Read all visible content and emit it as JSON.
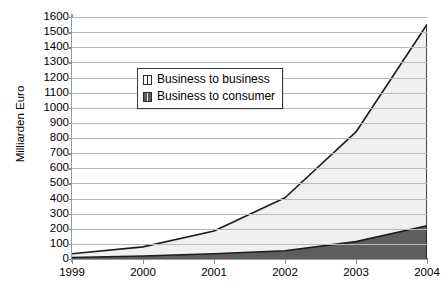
{
  "chart_data": {
    "type": "area",
    "stacked": true,
    "title": "",
    "xlabel": "",
    "ylabel": "Milliarden Euro",
    "categories": [
      "1999",
      "2000",
      "2001",
      "2002",
      "2003",
      "2004"
    ],
    "x": [
      1999,
      2000,
      2001,
      2002,
      2003,
      2004
    ],
    "series": [
      {
        "name": "Business to consumer",
        "values": [
          10,
          20,
          35,
          55,
          115,
          220
        ],
        "color": "#5e5e5e",
        "stack_order": 0
      },
      {
        "name": "Business to business",
        "values": [
          25,
          60,
          150,
          350,
          725,
          1330
        ],
        "color": "#f0f0f0",
        "stack_order": 1
      }
    ],
    "cumulative_totals": [
      35,
      80,
      185,
      405,
      840,
      1550
    ],
    "ylim": [
      0,
      1600
    ],
    "ytick_step": 100,
    "yticks": [
      0,
      100,
      200,
      300,
      400,
      500,
      600,
      700,
      800,
      900,
      1000,
      1100,
      1200,
      1300,
      1400,
      1500,
      1600
    ],
    "ytick_labels": [
      "0",
      "100",
      "200",
      "300",
      "400",
      "500",
      "600",
      "700",
      "800",
      "900",
      "1000",
      "1100",
      "1200",
      "1300",
      "1400",
      "1500",
      "1600"
    ],
    "grid": true,
    "grid_axis": "y",
    "legend_position": "upper-left-inside",
    "legend": [
      {
        "label": "Business to business",
        "swatch": "light-gray"
      },
      {
        "label": "Business to consumer",
        "swatch": "dark-gray"
      }
    ],
    "colors": {
      "business_to_business_fill": "#f0f0f0",
      "business_to_consumer_fill": "#5e5e5e",
      "line_stroke": "#1c1c1c",
      "gridline": "#b9b9b9",
      "axis_line": "#9a9a9a",
      "background": "#ffffff",
      "text": "#000000"
    }
  }
}
